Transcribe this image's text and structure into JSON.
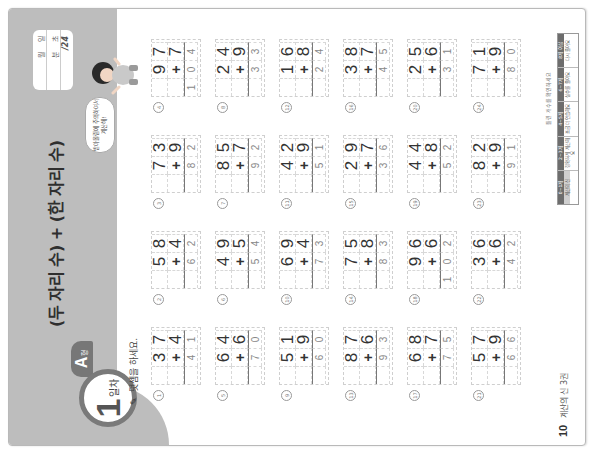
{
  "header": {
    "day_number": "1",
    "day_label": "일차",
    "type_letter": "A",
    "type_suffix": "형",
    "title": "(두 자리 수) + (한 자리 수)"
  },
  "score_box": {
    "month_label": "월",
    "day_label": "일",
    "minute_label": "분",
    "second_label": "초",
    "total": "/24"
  },
  "speech_bubble": {
    "line1": "받아올림에 주의하여서",
    "line2": "계산해!"
  },
  "instruction": {
    "icon": "pencil-icon",
    "text": "덧셈을 하세요."
  },
  "problems": [
    {
      "num": "1",
      "a": [
        "3",
        "7"
      ],
      "b": "4",
      "ans": [
        "",
        "4",
        "1"
      ]
    },
    {
      "num": "2",
      "a": [
        "5",
        "8"
      ],
      "b": "4",
      "ans": [
        "",
        "6",
        "2"
      ]
    },
    {
      "num": "3",
      "a": [
        "7",
        "3"
      ],
      "b": "9",
      "ans": [
        "",
        "8",
        "2"
      ]
    },
    {
      "num": "4",
      "a": [
        "9",
        "7"
      ],
      "b": "7",
      "ans": [
        "1",
        "0",
        "4"
      ]
    },
    {
      "num": "5",
      "a": [
        "6",
        "4"
      ],
      "b": "6",
      "ans": [
        "",
        "7",
        "0"
      ]
    },
    {
      "num": "6",
      "a": [
        "4",
        "9"
      ],
      "b": "5",
      "ans": [
        "",
        "5",
        "4"
      ]
    },
    {
      "num": "7",
      "a": [
        "8",
        "5"
      ],
      "b": "7",
      "ans": [
        "",
        "9",
        "2"
      ]
    },
    {
      "num": "8",
      "a": [
        "2",
        "4"
      ],
      "b": "9",
      "ans": [
        "",
        "3",
        "3"
      ]
    },
    {
      "num": "9",
      "a": [
        "5",
        "1"
      ],
      "b": "9",
      "ans": [
        "",
        "6",
        "0"
      ]
    },
    {
      "num": "10",
      "a": [
        "6",
        "9"
      ],
      "b": "4",
      "ans": [
        "",
        "7",
        "3"
      ]
    },
    {
      "num": "11",
      "a": [
        "4",
        "2"
      ],
      "b": "9",
      "ans": [
        "",
        "5",
        "1"
      ]
    },
    {
      "num": "12",
      "a": [
        "1",
        "6"
      ],
      "b": "8",
      "ans": [
        "",
        "2",
        "4"
      ]
    },
    {
      "num": "13",
      "a": [
        "8",
        "7"
      ],
      "b": "6",
      "ans": [
        "",
        "9",
        "3"
      ]
    },
    {
      "num": "14",
      "a": [
        "7",
        "5"
      ],
      "b": "8",
      "ans": [
        "",
        "8",
        "3"
      ]
    },
    {
      "num": "15",
      "a": [
        "2",
        "9"
      ],
      "b": "7",
      "ans": [
        "",
        "3",
        "6"
      ]
    },
    {
      "num": "16",
      "a": [
        "3",
        "8"
      ],
      "b": "7",
      "ans": [
        "",
        "4",
        "5"
      ]
    },
    {
      "num": "17",
      "a": [
        "6",
        "8"
      ],
      "b": "7",
      "ans": [
        "",
        "7",
        "5"
      ]
    },
    {
      "num": "18",
      "a": [
        "9",
        "6"
      ],
      "b": "6",
      "ans": [
        "1",
        "0",
        "2"
      ]
    },
    {
      "num": "19",
      "a": [
        "4",
        "4"
      ],
      "b": "8",
      "ans": [
        "",
        "5",
        "2"
      ]
    },
    {
      "num": "20",
      "a": [
        "2",
        "5"
      ],
      "b": "6",
      "ans": [
        "",
        "3",
        "1"
      ]
    },
    {
      "num": "21",
      "a": [
        "5",
        "7"
      ],
      "b": "9",
      "ans": [
        "",
        "6",
        "6"
      ]
    },
    {
      "num": "22",
      "a": [
        "3",
        "6"
      ],
      "b": "6",
      "ans": [
        "",
        "4",
        "2"
      ]
    },
    {
      "num": "23",
      "a": [
        "8",
        "2"
      ],
      "b": "9",
      "ans": [
        "",
        "9",
        "1"
      ]
    },
    {
      "num": "24",
      "a": [
        "7",
        "1"
      ],
      "b": "9",
      "ans": [
        "",
        "8",
        "0"
      ]
    }
  ],
  "plus_sign": "+",
  "footer": {
    "note": "틀린 개수를 확인하세요",
    "eval_table": [
      {
        "head": "0~1개",
        "body": "계산의 신"
      },
      {
        "head": "2~3개",
        "body": "정확하게 계산해요"
      },
      {
        "head": "4~5개",
        "body": "조금 더 연습해요"
      },
      {
        "head": "6~7개",
        "body": "실수를 줄여요"
      },
      {
        "head": "8개 이상",
        "body": "다시 풀어요"
      }
    ],
    "page_number": "10",
    "book_title": "계산의 신 3권"
  },
  "colors": {
    "header_band": "#bdbdbd",
    "badge_ring": "#7a7a7a",
    "type_tab": "#777777",
    "text": "#333333",
    "answer_text": "#888888"
  }
}
